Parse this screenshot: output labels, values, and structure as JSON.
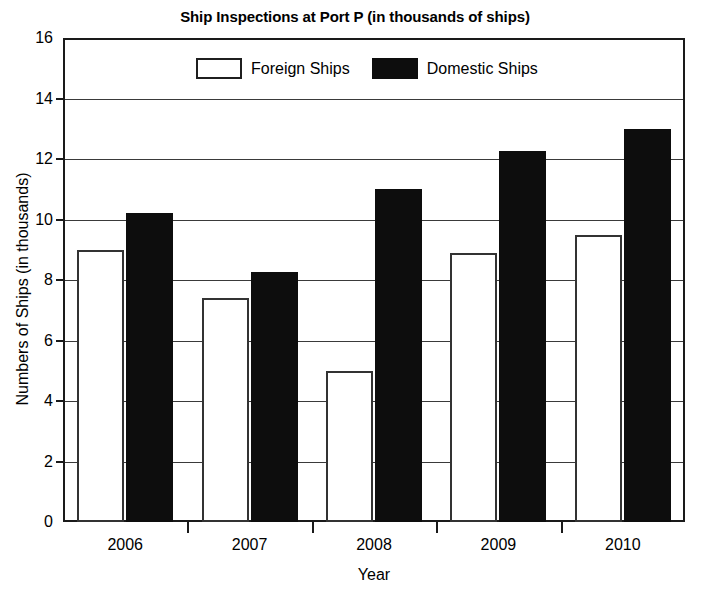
{
  "chart_data": {
    "type": "bar",
    "title": "Ship Inspections at Port P (in thousands of ships)",
    "xlabel": "Year",
    "ylabel": "Numbers of Ships (in thousands)",
    "categories": [
      "2006",
      "2007",
      "2008",
      "2009",
      "2010"
    ],
    "series": [
      {
        "name": "Foreign Ships",
        "color": "#ffffff",
        "values": [
          9.0,
          7.4,
          5.0,
          8.9,
          9.5
        ]
      },
      {
        "name": "Domestic Ships",
        "color": "#0d0d0d",
        "values": [
          10.2,
          8.25,
          11.0,
          12.25,
          13.0
        ]
      }
    ],
    "ylim": [
      0,
      16
    ],
    "ytick_labels": [
      "0",
      "2",
      "4",
      "6",
      "8",
      "10",
      "12",
      "14",
      "16"
    ],
    "ytick_values": [
      0,
      2,
      4,
      6,
      8,
      10,
      12,
      14,
      16
    ],
    "grid": true,
    "legend_position": "top-center"
  },
  "legend": {
    "items": [
      {
        "label": "Foreign Ships",
        "swatch": "white-rect-swatch"
      },
      {
        "label": "Domestic Ships",
        "swatch": "black-rect-swatch"
      }
    ]
  }
}
